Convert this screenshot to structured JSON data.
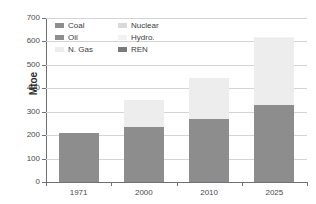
{
  "chart_data": {
    "type": "bar",
    "subtype": "stacked-bar",
    "title": "",
    "xlabel": "",
    "ylabel": "Mtoe",
    "categories": [
      "1971",
      "2000",
      "2010",
      "2025"
    ],
    "ylim": [
      0,
      700
    ],
    "ytick_values": [
      0,
      100,
      200,
      300,
      400,
      500,
      600,
      700
    ],
    "ytick_labels": [
      "0",
      "100",
      "200",
      "300",
      "400",
      "500",
      "600",
      "700"
    ],
    "grid": true,
    "legend_position": "top-left-inside",
    "legend_columns": 2,
    "series": [
      {
        "name": "Coal",
        "color": "#8d8d8d",
        "values": [
          0,
          0,
          30,
          55
        ],
        "legend_col": "left",
        "legend_order": 1
      },
      {
        "name": "Oil",
        "color": "#8d8d8d",
        "values": [
          208,
          235,
          240,
          275
        ],
        "legend_col": "left",
        "legend_order": 2
      },
      {
        "name": "N. Gas",
        "color": "#ededed",
        "values": [
          0,
          115,
          172,
          285
        ],
        "legend_col": "left",
        "legend_order": 3
      },
      {
        "name": "Nuclear",
        "color": "#d9d9d9",
        "values": [
          0,
          0,
          0,
          0
        ],
        "legend_col": "right",
        "legend_order": 4
      },
      {
        "name": "Hydro.",
        "color": "#f2f2f2",
        "values": [
          0,
          0,
          0,
          5
        ],
        "legend_col": "right",
        "legend_order": 5
      },
      {
        "name": "REN",
        "color": "#7a7a7a",
        "values": [
          0,
          0,
          0,
          0
        ],
        "legend_col": "right",
        "legend_order": 6
      }
    ],
    "bar_totals": [
      208,
      350,
      442,
      620
    ],
    "annotations": []
  },
  "legend": {
    "left_column": [
      {
        "label": "Coal",
        "color": "#8d8d8d"
      },
      {
        "label": "Oil",
        "color": "#8d8d8d"
      },
      {
        "label": "N. Gas",
        "color": "#ededed"
      }
    ],
    "right_column": [
      {
        "label": "Nuclear",
        "color": "#d9d9d9"
      },
      {
        "label": "Hydro.",
        "color": "#f2f2f2"
      },
      {
        "label": "REN",
        "color": "#7a7a7a"
      }
    ]
  },
  "axes": {
    "y_title": "Mtoe",
    "y_labels": [
      "700",
      "600",
      "500",
      "400",
      "300",
      "200",
      "100",
      "0"
    ],
    "x_labels": [
      "1971",
      "2000",
      "2010",
      "2025"
    ]
  },
  "colors": {
    "background": "#ffffff",
    "gridline": "#d2d4d6",
    "axis": "#6e7073",
    "text": "#4a4a4a",
    "bar_dark": "#8d8d8d",
    "bar_darker": "#7a7a7a",
    "bar_light": "#ededed",
    "bar_lighter": "#f2f2f2"
  },
  "bars": [
    {
      "category": "1971",
      "total": 208,
      "segments": [
        {
          "name": "Oil",
          "value": 208,
          "from": 0,
          "to": 208,
          "color": "#8d8d8d"
        }
      ]
    },
    {
      "category": "2000",
      "total": 350,
      "segments": [
        {
          "name": "Oil",
          "value": 235,
          "from": 0,
          "to": 235,
          "color": "#8d8d8d"
        },
        {
          "name": "N. Gas",
          "value": 115,
          "from": 235,
          "to": 350,
          "color": "#ededed"
        }
      ]
    },
    {
      "category": "2010",
      "total": 442,
      "segments": [
        {
          "name": "Coal",
          "value": 30,
          "from": 0,
          "to": 30,
          "color": "#8d8d8d"
        },
        {
          "name": "Oil",
          "value": 240,
          "from": 30,
          "to": 270,
          "color": "#8d8d8d"
        },
        {
          "name": "N. Gas",
          "value": 172,
          "from": 270,
          "to": 442,
          "color": "#ededed"
        }
      ]
    },
    {
      "category": "2025",
      "total": 620,
      "segments": [
        {
          "name": "Coal",
          "value": 55,
          "from": 0,
          "to": 55,
          "color": "#8d8d8d"
        },
        {
          "name": "Oil",
          "value": 275,
          "from": 55,
          "to": 330,
          "color": "#8d8d8d"
        },
        {
          "name": "N. Gas",
          "value": 285,
          "from": 330,
          "to": 615,
          "color": "#ededed"
        },
        {
          "name": "Hydro.",
          "value": 5,
          "from": 615,
          "to": 620,
          "color": "#f2f2f2"
        }
      ]
    }
  ]
}
